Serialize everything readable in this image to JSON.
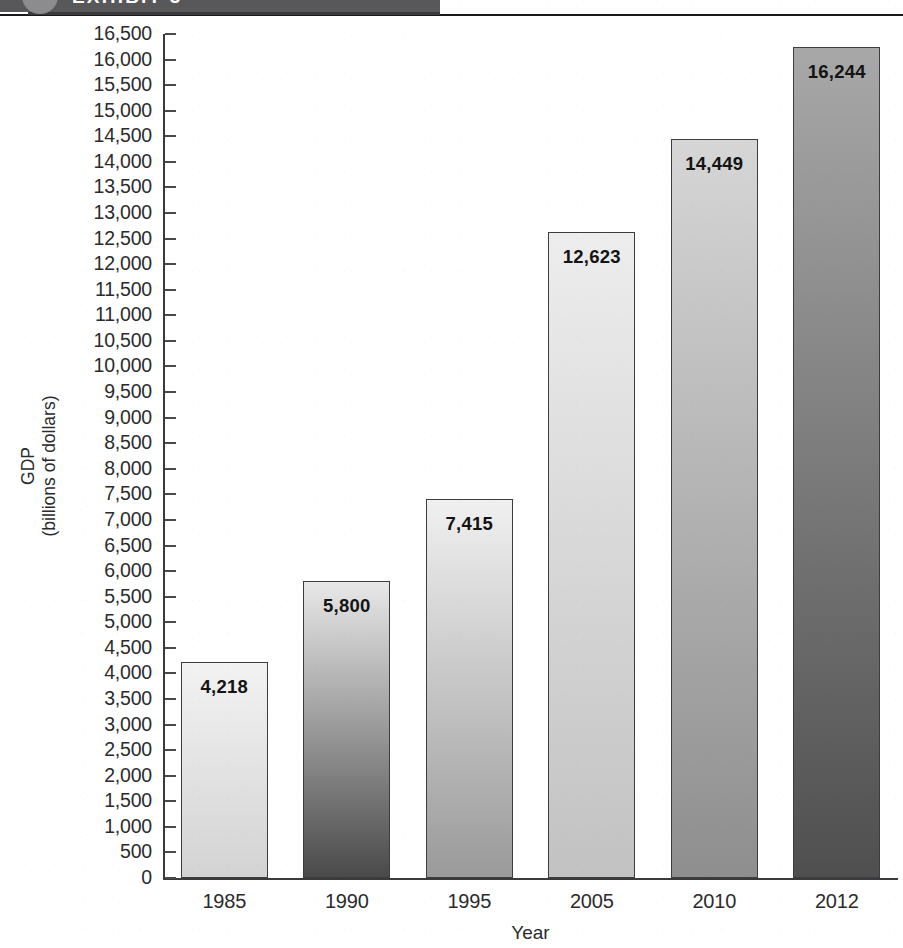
{
  "header": {
    "banner_label": "EXHIBIT 3",
    "circle_icon": "exhibit-bullet-circle"
  },
  "chart_data": {
    "type": "bar",
    "title": "",
    "xlabel": "Year",
    "ylabel": "GDP\n(billions of dollars)",
    "categories": [
      "1985",
      "1990",
      "1995",
      "2005",
      "2010",
      "2012"
    ],
    "values": [
      4218,
      5800,
      7415,
      12623,
      14449,
      16244
    ],
    "value_labels": [
      "4,218",
      "5,800",
      "7,415",
      "12,623",
      "14,449",
      "16,244"
    ],
    "ylim": [
      0,
      16500
    ],
    "ytick_step": 500,
    "ytick_labels": [
      "16,500",
      "16,000",
      "15,500",
      "15,000",
      "14,500",
      "14,000",
      "13,500",
      "13,000",
      "12,500",
      "12,000",
      "11,500",
      "11,000",
      "10,500",
      "10,000",
      "9,500",
      "9,000",
      "8,500",
      "8,000",
      "7,500",
      "7,000",
      "6,500",
      "6,000",
      "5,500",
      "5,000",
      "4,500",
      "4,000",
      "3,500",
      "3,000",
      "2,500",
      "2,000",
      "1,500",
      "1,000",
      "500",
      "0"
    ],
    "ytick_values": [
      16500,
      16000,
      15500,
      15000,
      14500,
      14000,
      13500,
      13000,
      12500,
      12000,
      11500,
      11000,
      10500,
      10000,
      9500,
      9000,
      8500,
      8000,
      7500,
      7000,
      6500,
      6000,
      5500,
      5000,
      4500,
      4000,
      3500,
      3000,
      2500,
      2000,
      1500,
      1000,
      500,
      0
    ],
    "grid": false,
    "legend": null,
    "bar_styles": [
      {
        "top": "#f2f2f2",
        "bottom": "#d3d3d3",
        "border": "#3d3d3f"
      },
      {
        "top": "#e8e8e8",
        "bottom": "#4a4a4a",
        "border": "#3d3d3f"
      },
      {
        "top": "#f0f0f0",
        "bottom": "#9a9a9a",
        "border": "#3d3d3f"
      },
      {
        "top": "#ededed",
        "bottom": "#c2c2c2",
        "border": "#3d3d3f"
      },
      {
        "top": "#d6d6d6",
        "bottom": "#8e8e8e",
        "border": "#3d3d3f"
      },
      {
        "top": "#a8a8a8",
        "bottom": "#4f4f4f",
        "border": "#3d3d3f"
      }
    ]
  }
}
